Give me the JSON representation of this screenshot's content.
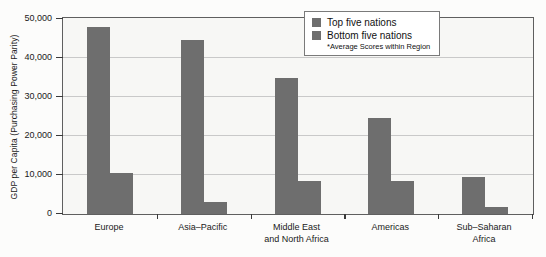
{
  "chart_data": {
    "type": "bar",
    "title": "",
    "xlabel": "",
    "ylabel": "GDP per Capita (Purchasing Power Parity)",
    "categories": [
      "Europe",
      "Asia–Pacific",
      "Middle East\nand North Africa",
      "Americas",
      "Sub–Saharan\nAfrica"
    ],
    "series": [
      {
        "name": "Top five nations",
        "values": [
          48000,
          44500,
          35000,
          24500,
          9500
        ],
        "color": "#6e6e6e"
      },
      {
        "name": "Bottom five nations",
        "values": [
          10500,
          3000,
          8500,
          8500,
          1800
        ],
        "color": "#6e6e6e"
      }
    ],
    "ylim": [
      0,
      50000
    ],
    "yticks": [
      0,
      10000,
      20000,
      30000,
      40000,
      50000
    ],
    "ytick_labels": [
      "0",
      "10,000",
      "20,000",
      "30,000",
      "40,000",
      "50,000"
    ],
    "grid": true,
    "legend_position": "upper right",
    "annotations": [
      "*Average Scores within Region"
    ]
  },
  "legend": {
    "items": [
      {
        "label": "Top five nations"
      },
      {
        "label": "Bottom five nations"
      }
    ],
    "note": "*Average Scores within Region"
  }
}
